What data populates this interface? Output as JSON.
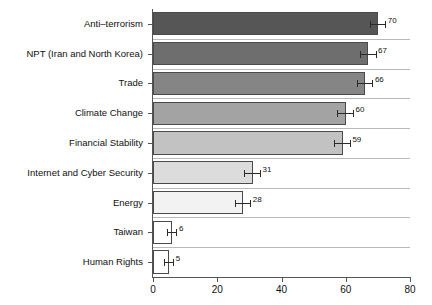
{
  "chart_data": {
    "type": "bar",
    "orientation": "horizontal",
    "title": "",
    "subtitle": "",
    "xlabel": "",
    "ylabel": "",
    "xlim": [
      0,
      80
    ],
    "xticks": [
      0,
      20,
      40,
      60,
      80
    ],
    "xtick_labels": [
      "0",
      "20",
      "40",
      "60",
      "80"
    ],
    "grid": true,
    "grid_axis": "y",
    "legend": false,
    "legend_position": "none",
    "categories": [
      "Anti–terrorism",
      "NPT (Iran and North Korea)",
      "Trade",
      "Climate Change",
      "Financial Stability",
      "Internet and Cyber Security",
      "Energy",
      "Taiwan",
      "Human Rights"
    ],
    "values": [
      70,
      67,
      66,
      60,
      59,
      31,
      28,
      6,
      5
    ],
    "value_labels": [
      "70",
      "67",
      "66",
      "60",
      "59",
      "31",
      "28",
      "6",
      "5"
    ],
    "errors": [
      2.6,
      2.6,
      2.6,
      2.6,
      2.6,
      2.6,
      2.6,
      1.6,
      1.6
    ],
    "bar_colors": [
      "#565656",
      "#6e6e6e",
      "#858585",
      "#a3a3a3",
      "#c2c2c2",
      "#dcdcdc",
      "#f2f2f2",
      "#ffffff",
      "#ffffff"
    ],
    "bar_edge_color": "#4a4a4a",
    "error_bar_color": "#2b2b2b",
    "axis_color": "#555555",
    "grid_color": "#b9b9b9",
    "background_color": "#ffffff"
  }
}
